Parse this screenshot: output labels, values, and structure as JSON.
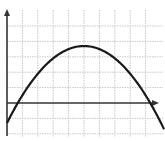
{
  "chart_data": {
    "type": "line",
    "title": "",
    "xlabel": "",
    "ylabel": "",
    "grid": true,
    "legend": null,
    "xlim": [
      0,
      10
    ],
    "ylim": [
      -2,
      6
    ],
    "series": [
      {
        "name": "parabola",
        "equation": "y = -0.2*(x-5)^2 + 3.7",
        "x": [
          0,
          0.7,
          1,
          2,
          3,
          4,
          5,
          6,
          7,
          8,
          9,
          9.3,
          10
        ],
        "values": [
          -1.3,
          0,
          0.5,
          1.9,
          2.9,
          3.5,
          3.7,
          3.5,
          2.9,
          1.9,
          0.5,
          0,
          -1.3
        ]
      }
    ],
    "annotations": {
      "vertex": [
        5,
        3.7
      ],
      "roots": [
        0.7,
        9.3
      ]
    },
    "colors": {
      "curve": "#1a1a1a",
      "axes": "#333333",
      "grid": "#c8c8c8"
    }
  }
}
